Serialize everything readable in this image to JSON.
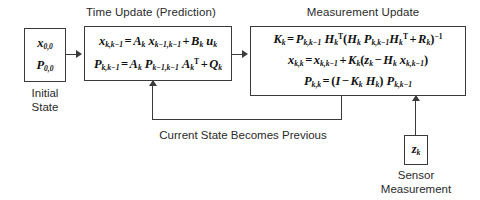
{
  "diagram": {
    "headings": {
      "time_update": "Time Update (Prediction)",
      "measurement_update": "Measurement Update"
    },
    "initial_state": {
      "caption_line1": "Initial",
      "caption_line2": "State",
      "state_var": "x",
      "state_sub": "0,0",
      "cov_var": "P",
      "cov_sub": "0,0"
    },
    "time_update": {
      "equations": [
        "x_{k,k-1} = A_k x_{k-1,k-1} + B_k u_k",
        "P_{k,k-1} = A_k P_{k-1,k-1} A_k^T + Q_k"
      ]
    },
    "measurement_update": {
      "equations": [
        "K_k = P_{k,k-1} H_k^T (H_k P_{k,k-1} H_k^T + R_k)^{-1}",
        "x_{k,k} = x_{k,k-1} + K_k (z_k - H_k x_{k,k-1})",
        "P_{k,k} = (I - K_k H_k) P_{k,k-1}"
      ]
    },
    "feedback": {
      "label": "Current State Becomes Previous"
    },
    "sensor": {
      "var": "z",
      "sub": "k",
      "caption_line1": "Sensor",
      "caption_line2": "Measurement"
    },
    "colors": {
      "stroke": "#3a3a3a",
      "text": "#2a2a2a",
      "background": "#ffffff"
    }
  }
}
